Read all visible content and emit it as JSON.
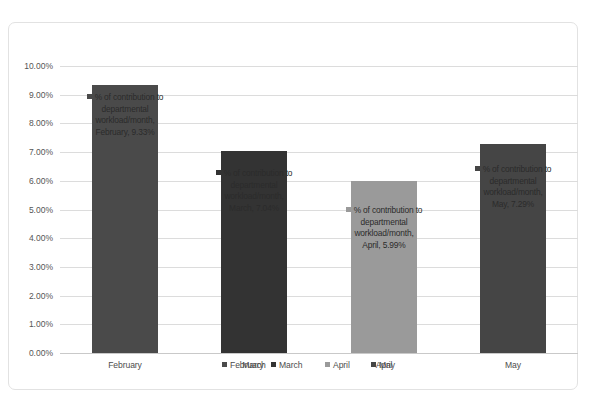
{
  "chart_data": {
    "type": "bar",
    "title": "",
    "xlabel": "",
    "ylabel": "",
    "categories": [
      "February",
      "March",
      "April",
      "May"
    ],
    "values": [
      9.33,
      7.04,
      5.99,
      7.29
    ],
    "value_labels": [
      "9.33%",
      "7.04%",
      "5.99%",
      "7.29%"
    ],
    "series": [
      {
        "name": "% of contribution to departmental workload/month",
        "values": [
          9.33,
          7.04,
          5.99,
          7.29
        ]
      }
    ],
    "ylim": [
      0,
      10
    ],
    "ytick_labels": [
      "0.00%",
      "1.00%",
      "2.00%",
      "3.00%",
      "4.00%",
      "5.00%",
      "6.00%",
      "7.00%",
      "8.00%",
      "9.00%",
      "10.00%"
    ],
    "ytick_values": [
      0,
      1,
      2,
      3,
      4,
      5,
      6,
      7,
      8,
      9,
      10
    ],
    "grid": true,
    "legend_position": "bottom",
    "bar_colors": [
      "#4a4a4a",
      "#333333",
      "#9a9a9a",
      "#454545"
    ],
    "data_labels": [
      {
        "series_name": "% of contribution to departmental workload/month",
        "line1": "% of contribution to",
        "line2": "departmental",
        "line3": "workload/month,",
        "line4": "February, 9.33%",
        "category": "February",
        "value_text": "9.33%"
      },
      {
        "series_name": "% of contribution to departmental workload/month",
        "line1": "% of contribution to",
        "line2": "departmental",
        "line3": "workload/month,",
        "line4": "March, 7.04%",
        "category": "March",
        "value_text": "7.04%"
      },
      {
        "series_name": "% of contribution to departmental workload/month",
        "line1": "% of contribution to",
        "line2": "departmental",
        "line3": "workload/month,",
        "line4": "April, 5.99%",
        "category": "April",
        "value_text": "5.99%"
      },
      {
        "series_name": "% of contribution to departmental workload/month",
        "line1": "% of contribution to",
        "line2": "departmental",
        "line3": "workload/month,",
        "line4": "May, 7.29%",
        "category": "May",
        "value_text": "7.29%"
      }
    ],
    "legend_entries": [
      {
        "label": "February",
        "color": "#4a4a4a"
      },
      {
        "label": "March",
        "color": "#333333"
      },
      {
        "label": "April",
        "color": "#9a9a9a"
      },
      {
        "label": "May",
        "color": "#454545"
      }
    ],
    "category_axis_labels": [
      "February",
      "March",
      "April",
      "May"
    ]
  }
}
